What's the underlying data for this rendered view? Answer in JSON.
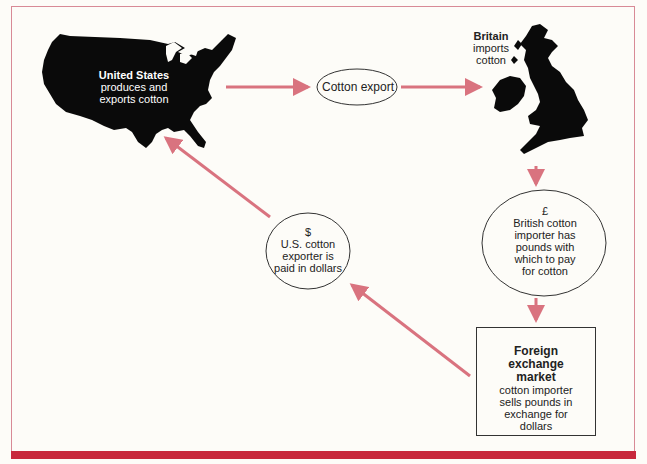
{
  "diagram": {
    "nodes": {
      "united_states": {
        "title": "United States",
        "line1": "produces and",
        "line2": "exports cotton"
      },
      "britain": {
        "title": "Britain",
        "line1": "imports",
        "line2": "cotton"
      },
      "cotton_export": {
        "label": "Cotton export"
      },
      "pound_circle": {
        "symbol": "£",
        "line1": "British cotton",
        "line2": "importer has",
        "line3": "pounds with",
        "line4": "which to pay",
        "line5": "for cotton"
      },
      "dollar_circle": {
        "symbol": "$",
        "line1": "U.S. cotton",
        "line2": "exporter is",
        "line3": "paid in dollars"
      },
      "fx_market": {
        "title1": "Foreign",
        "title2": "exchange",
        "title3": "market",
        "line1": "cotton importer",
        "line2": "sells pounds in",
        "line3": "exchange for",
        "line4": "dollars"
      }
    },
    "edges": [
      {
        "from": "united_states",
        "to": "cotton_export"
      },
      {
        "from": "cotton_export",
        "to": "britain"
      },
      {
        "from": "britain",
        "to": "pound_circle"
      },
      {
        "from": "pound_circle",
        "to": "fx_market"
      },
      {
        "from": "fx_market",
        "to": "dollar_circle"
      },
      {
        "from": "dollar_circle",
        "to": "united_states"
      }
    ],
    "colors": {
      "arrow": "#d9737f",
      "frame": "#d88a96",
      "band": "#c8283c",
      "map": "#0a0a0a"
    }
  }
}
